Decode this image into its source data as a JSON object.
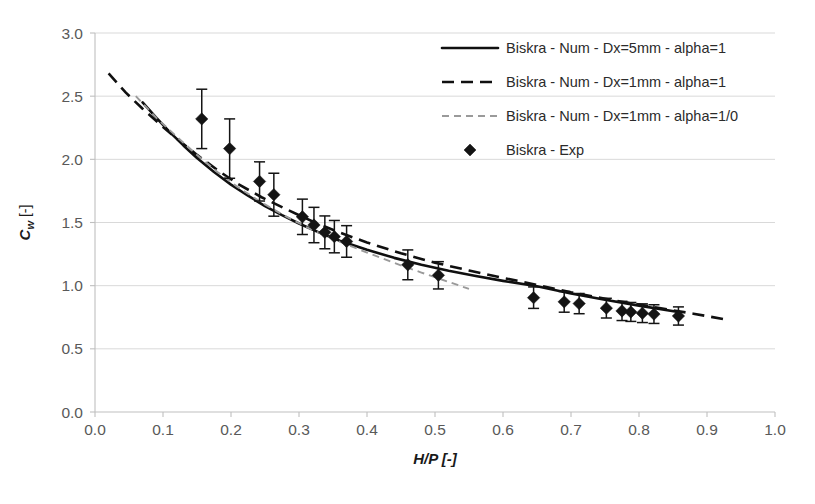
{
  "chart_data": {
    "type": "line",
    "title": "",
    "xlabel": "H/P [-]",
    "ylabel": "Cw [-]",
    "ylabel_base": "C",
    "ylabel_sub": "w",
    "ylabel_unit": " [-]",
    "xlim": [
      0.0,
      1.0
    ],
    "ylim": [
      0.0,
      3.0
    ],
    "xticks": [
      "0.0",
      "0.1",
      "0.2",
      "0.3",
      "0.4",
      "0.5",
      "0.6",
      "0.7",
      "0.8",
      "0.9",
      "1.0"
    ],
    "xtick_values": [
      0.0,
      0.1,
      0.2,
      0.3,
      0.4,
      0.5,
      0.6,
      0.7,
      0.8,
      0.9,
      1.0
    ],
    "yticks": [
      "0.0",
      "0.5",
      "1.0",
      "1.5",
      "2.0",
      "2.5",
      "3.0"
    ],
    "ytick_values": [
      0.0,
      0.5,
      1.0,
      1.5,
      2.0,
      2.5,
      3.0
    ],
    "grid": true,
    "legend_position": "top-right",
    "series": [
      {
        "name": "Biskra - Num - Dx=5mm - alpha=1",
        "style": "solid",
        "color": "#101010",
        "x": [
          0.07,
          0.09,
          0.11,
          0.13,
          0.15,
          0.175,
          0.2,
          0.225,
          0.25,
          0.275,
          0.3,
          0.33,
          0.36,
          0.4,
          0.44,
          0.48,
          0.52,
          0.56,
          0.6,
          0.65,
          0.7,
          0.75,
          0.8,
          0.86
        ],
        "y": [
          2.45,
          2.33,
          2.215,
          2.11,
          2.01,
          1.9,
          1.8,
          1.712,
          1.63,
          1.558,
          1.492,
          1.42,
          1.356,
          1.284,
          1.22,
          1.166,
          1.118,
          1.076,
          1.038,
          0.996,
          0.938,
          0.888,
          0.842,
          0.79
        ]
      },
      {
        "name": "Biskra - Num - Dx=1mm - alpha=1",
        "style": "dashed",
        "color": "#101010",
        "x": [
          0.02,
          0.045,
          0.07,
          0.095,
          0.12,
          0.15,
          0.18,
          0.21,
          0.245,
          0.28,
          0.32,
          0.36,
          0.4,
          0.45,
          0.5,
          0.55,
          0.6,
          0.65,
          0.7,
          0.76,
          0.82,
          0.88,
          0.93
        ],
        "y": [
          2.68,
          2.53,
          2.4,
          2.28,
          2.165,
          2.035,
          1.915,
          1.806,
          1.7,
          1.608,
          1.508,
          1.42,
          1.342,
          1.256,
          1.182,
          1.12,
          1.062,
          1.006,
          0.948,
          0.886,
          0.832,
          0.778,
          0.73
        ]
      },
      {
        "name": "Biskra - Num - Dx=1mm - alpha=1/0",
        "style": "gray-dashed",
        "color": "#9a9a9a",
        "x": [
          0.06,
          0.09,
          0.12,
          0.15,
          0.18,
          0.21,
          0.245,
          0.28,
          0.32,
          0.36,
          0.4,
          0.44,
          0.48,
          0.52,
          0.55
        ],
        "y": [
          2.5,
          2.33,
          2.18,
          2.035,
          1.9,
          1.78,
          1.658,
          1.55,
          1.44,
          1.348,
          1.262,
          1.18,
          1.104,
          1.03,
          0.975
        ]
      }
    ],
    "scatter": {
      "name": "Biskra - Exp",
      "marker": "diamond",
      "color": "#141414",
      "points": [
        {
          "x": 0.157,
          "y": 2.32,
          "err": 0.235
        },
        {
          "x": 0.198,
          "y": 2.085,
          "err": 0.235
        },
        {
          "x": 0.242,
          "y": 1.825,
          "err": 0.155
        },
        {
          "x": 0.263,
          "y": 1.72,
          "err": 0.17
        },
        {
          "x": 0.305,
          "y": 1.545,
          "err": 0.14
        },
        {
          "x": 0.322,
          "y": 1.48,
          "err": 0.14
        },
        {
          "x": 0.338,
          "y": 1.422,
          "err": 0.13
        },
        {
          "x": 0.352,
          "y": 1.388,
          "err": 0.128
        },
        {
          "x": 0.37,
          "y": 1.35,
          "err": 0.125
        },
        {
          "x": 0.46,
          "y": 1.165,
          "err": 0.118
        },
        {
          "x": 0.505,
          "y": 1.082,
          "err": 0.108
        },
        {
          "x": 0.645,
          "y": 0.905,
          "err": 0.085
        },
        {
          "x": 0.69,
          "y": 0.872,
          "err": 0.082
        },
        {
          "x": 0.712,
          "y": 0.858,
          "err": 0.08
        },
        {
          "x": 0.752,
          "y": 0.822,
          "err": 0.078
        },
        {
          "x": 0.775,
          "y": 0.8,
          "err": 0.076
        },
        {
          "x": 0.788,
          "y": 0.792,
          "err": 0.075
        },
        {
          "x": 0.805,
          "y": 0.782,
          "err": 0.074
        },
        {
          "x": 0.822,
          "y": 0.775,
          "err": 0.074
        },
        {
          "x": 0.858,
          "y": 0.76,
          "err": 0.072
        }
      ]
    },
    "legend": [
      {
        "label": "Biskra - Num - Dx=5mm - alpha=1",
        "style": "solid",
        "color": "#101010"
      },
      {
        "label": "Biskra - Num - Dx=1mm - alpha=1",
        "style": "dashed",
        "color": "#101010"
      },
      {
        "label": "Biskra - Num - Dx=1mm - alpha=1/0",
        "style": "gray-dashed",
        "color": "#9a9a9a"
      },
      {
        "label": "Biskra - Exp",
        "style": "marker",
        "color": "#141414"
      }
    ]
  }
}
